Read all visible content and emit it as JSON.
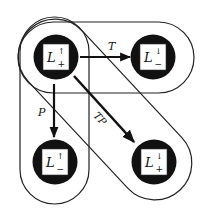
{
  "diagram": {
    "type": "state-transition",
    "colors": {
      "background": "#ffffff",
      "stroke": "#222222",
      "node_fill": "#111111",
      "node_inner": "#ffffff"
    },
    "nodes": [
      {
        "id": "top-left",
        "base": "L",
        "sup": "↑",
        "sub": "+",
        "cx": 56,
        "cy": 57
      },
      {
        "id": "top-right",
        "base": "L",
        "sup": "↓",
        "sub": "−",
        "cx": 153,
        "cy": 57
      },
      {
        "id": "bottom-left",
        "base": "L",
        "sup": "↑",
        "sub": "−",
        "cx": 55,
        "cy": 162
      },
      {
        "id": "bottom-right",
        "base": "L",
        "sup": "↓",
        "sub": "+",
        "cx": 154,
        "cy": 162
      }
    ],
    "edges": [
      {
        "id": "T",
        "label": "T",
        "from": "top-left",
        "to": "top-right"
      },
      {
        "id": "P",
        "label": "P",
        "from": "top-left",
        "to": "bottom-left"
      },
      {
        "id": "TP",
        "label": "TP",
        "from": "top-left",
        "to": "bottom-right"
      }
    ],
    "groups": [
      {
        "id": "horizontal-group",
        "members": [
          "top-left",
          "top-right"
        ]
      },
      {
        "id": "vertical-group",
        "members": [
          "top-left",
          "bottom-left"
        ]
      },
      {
        "id": "diagonal-group",
        "members": [
          "top-left",
          "bottom-right"
        ]
      }
    ]
  }
}
